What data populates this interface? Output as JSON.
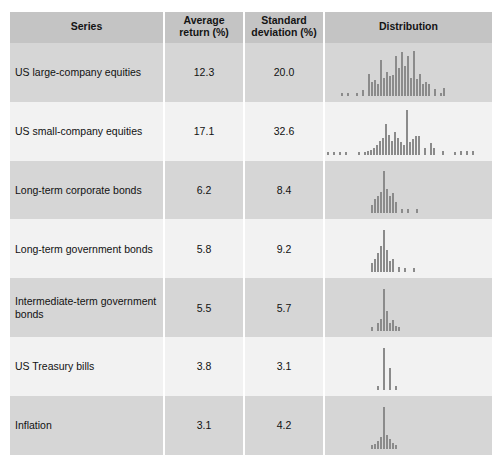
{
  "table": {
    "columns": [
      {
        "key": "series",
        "label": "Series"
      },
      {
        "key": "avg",
        "label": "Average\nreturn (%)"
      },
      {
        "key": "sd",
        "label": "Standard\ndeviation (%)"
      },
      {
        "key": "dist",
        "label": "Distribution"
      }
    ],
    "header": {
      "series": "Series",
      "avg_line1": "Average",
      "avg_line2": "return (%)",
      "sd_line1": "Standard",
      "sd_line2": "deviation (%)",
      "dist": "Distribution"
    },
    "rows": [
      {
        "series": "US large-company equities",
        "avg": "12.3",
        "sd": "20.0"
      },
      {
        "series": "US small-company equities",
        "avg": "17.1",
        "sd": "32.6"
      },
      {
        "series": "Long-term corporate bonds",
        "avg": "6.2",
        "sd": "8.4"
      },
      {
        "series": "Long-term government bonds",
        "avg": "5.8",
        "sd": "9.2"
      },
      {
        "series": "Intermediate-term government bonds",
        "avg": "5.5",
        "sd": "5.7"
      },
      {
        "series": "US Treasury bills",
        "avg": "3.8",
        "sd": "3.1"
      },
      {
        "series": "Inflation",
        "avg": "3.1",
        "sd": "4.2"
      }
    ]
  },
  "colors": {
    "header_bg": "#c4c4c4",
    "row_shaded": "#d6d6d6",
    "row_light": "#f2f2f2",
    "bar": "#8b8b8b",
    "text": "#111111",
    "divider": "#ffffff"
  },
  "chart_data": [
    {
      "type": "bar",
      "title": "US large-company equities",
      "xlabel": "Annual return (%)",
      "ylabel": "Frequency",
      "mean": 12.3,
      "std_dev": 20.0,
      "bar_left_px": [
        16,
        22,
        31,
        37,
        43,
        46,
        49,
        52,
        55,
        58,
        61,
        64,
        67,
        70,
        73,
        76,
        79,
        82,
        85,
        88,
        91,
        94,
        97,
        100,
        103,
        109,
        115,
        118
      ],
      "values": [
        3,
        3,
        3,
        6,
        22,
        14,
        16,
        12,
        36,
        18,
        24,
        20,
        21,
        40,
        28,
        44,
        30,
        40,
        18,
        45,
        17,
        22,
        12,
        14,
        12,
        7,
        3,
        8
      ]
    },
    {
      "type": "bar",
      "title": "US small-company equities",
      "xlabel": "Annual return (%)",
      "ylabel": "Frequency",
      "mean": 17.1,
      "std_dev": 32.6,
      "bar_left_px": [
        2,
        8,
        14,
        20,
        33,
        39,
        42,
        45,
        48,
        51,
        54,
        57,
        60,
        63,
        66,
        69,
        72,
        75,
        78,
        81,
        84,
        87,
        90,
        93,
        99,
        105,
        108,
        117,
        129,
        135,
        141,
        147
      ],
      "values": [
        3,
        3,
        3,
        3,
        3,
        3,
        4,
        5,
        7,
        10,
        14,
        17,
        31,
        20,
        14,
        23,
        17,
        13,
        10,
        45,
        13,
        16,
        19,
        19,
        7,
        12,
        7,
        4,
        3,
        4,
        4,
        4
      ]
    },
    {
      "type": "bar",
      "title": "Long-term corporate bonds",
      "xlabel": "Annual return (%)",
      "ylabel": "Frequency",
      "mean": 6.2,
      "std_dev": 8.4,
      "bar_left_px": [
        46,
        49,
        52,
        55,
        58,
        61,
        64,
        67,
        70,
        76,
        82,
        91
      ],
      "values": [
        8,
        14,
        17,
        21,
        42,
        24,
        17,
        20,
        11,
        4,
        4,
        4
      ]
    },
    {
      "type": "bar",
      "title": "Long-term government bonds",
      "xlabel": "Annual return (%)",
      "ylabel": "Frequency",
      "mean": 5.8,
      "std_dev": 9.2,
      "bar_left_px": [
        46,
        49,
        52,
        55,
        58,
        61,
        64,
        67,
        73,
        79,
        88
      ],
      "values": [
        9,
        13,
        19,
        26,
        42,
        22,
        11,
        13,
        5,
        4,
        4
      ]
    },
    {
      "type": "bar",
      "title": "Intermediate-term government bonds",
      "xlabel": "Annual return (%)",
      "ylabel": "Frequency",
      "mean": 5.5,
      "std_dev": 5.7,
      "bar_left_px": [
        46,
        52,
        55,
        58,
        61,
        64,
        67,
        70,
        73
      ],
      "values": [
        4,
        8,
        12,
        42,
        20,
        8,
        11,
        5,
        4
      ]
    },
    {
      "type": "bar",
      "title": "US Treasury bills",
      "xlabel": "Annual return (%)",
      "ylabel": "Frequency",
      "mean": 3.8,
      "std_dev": 3.1,
      "bar_left_px": [
        52,
        58,
        64,
        70
      ],
      "values": [
        4,
        42,
        22,
        4
      ]
    },
    {
      "type": "bar",
      "title": "Inflation",
      "xlabel": "Annual return (%)",
      "ylabel": "Frequency",
      "mean": 3.1,
      "std_dev": 4.2,
      "bar_left_px": [
        46,
        49,
        52,
        55,
        58,
        61,
        64,
        67,
        70
      ],
      "values": [
        4,
        5,
        8,
        12,
        42,
        14,
        10,
        6,
        4
      ]
    }
  ]
}
